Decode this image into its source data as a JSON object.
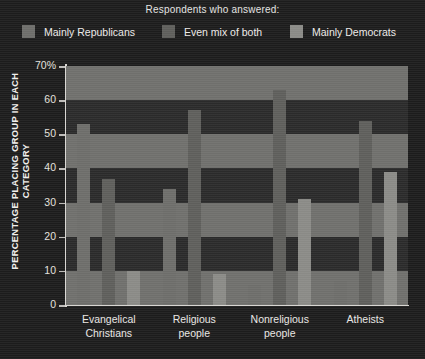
{
  "legend": {
    "title": "Respondents who answered:",
    "items": [
      {
        "label": "Mainly Republicans",
        "color": "#6d6d6a",
        "swatch_name": "legend-swatch-republicans"
      },
      {
        "label": "Even mix of both",
        "color": "#5e5e5b",
        "swatch_name": "legend-swatch-even-mix"
      },
      {
        "label": "Mainly Democrats",
        "color": "#8a8a86",
        "swatch_name": "legend-swatch-democrats"
      }
    ]
  },
  "chart_data": {
    "type": "bar",
    "title": "Respondents who answered:",
    "xlabel": "",
    "ylabel": "PERCENTAGE PLACING GROUP IN EACH CATEGORY",
    "ylim": [
      0,
      70
    ],
    "ytick_labels": [
      "0",
      "10",
      "20",
      "30",
      "40",
      "50",
      "60",
      "70%"
    ],
    "ytick_values": [
      0,
      10,
      20,
      30,
      40,
      50,
      60,
      70
    ],
    "grid": "horizontal-bands",
    "legend_position": "top",
    "categories": [
      "Evangelical Christians",
      "Religious people",
      "Nonreligious people",
      "Atheists"
    ],
    "category_lines": [
      [
        "Evangelical",
        "Christians"
      ],
      [
        "Religious",
        "people"
      ],
      [
        "Nonreligious",
        "people"
      ],
      [
        "Atheists"
      ]
    ],
    "series": [
      {
        "name": "Mainly Republicans",
        "color": "#6d6d6a",
        "values": [
          53,
          34,
          6,
          7
        ]
      },
      {
        "name": "Even mix of both",
        "color": "#5e5e5b",
        "values": [
          37,
          57,
          63,
          54
        ]
      },
      {
        "name": "Mainly Democrats",
        "color": "#8a8a86",
        "values": [
          10,
          9,
          31,
          39
        ]
      }
    ]
  },
  "plot": {
    "band_color": "#6f6f6c",
    "background": "#2a2a2a",
    "axis_color": "#d8d6d2"
  }
}
